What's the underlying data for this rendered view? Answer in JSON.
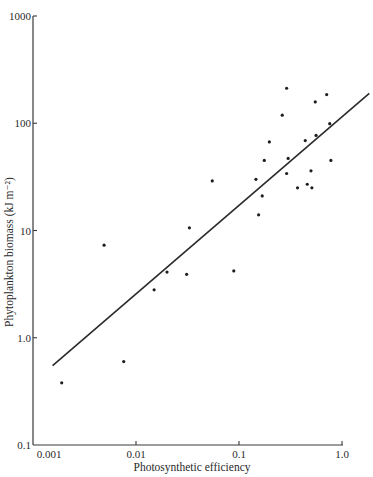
{
  "chart_data": {
    "type": "scatter",
    "title": "",
    "xlabel": "Photosynthetic efficiency",
    "ylabel": "Phytoplankton biomass (kJ m⁻²)",
    "xscale": "log",
    "yscale": "log",
    "xlim": [
      0.001,
      1.0
    ],
    "ylim": [
      0.1,
      1000
    ],
    "grid": false,
    "legend": null,
    "x_ticks": [
      {
        "value": 0.001,
        "label": "0.001"
      },
      {
        "value": 0.01,
        "label": "0.01"
      },
      {
        "value": 0.1,
        "label": "0.1"
      },
      {
        "value": 1.0,
        "label": "1.0"
      }
    ],
    "y_ticks": [
      {
        "value": 0.1,
        "label": "0.1"
      },
      {
        "value": 1.0,
        "label": "1.0"
      },
      {
        "value": 10,
        "label": "10"
      },
      {
        "value": 100,
        "label": "100"
      },
      {
        "value": 1000,
        "label": "1000"
      }
    ],
    "series": [
      {
        "name": "observations",
        "type": "scatter",
        "points": [
          {
            "x": 0.0019,
            "y": 0.38
          },
          {
            "x": 0.0049,
            "y": 7.3
          },
          {
            "x": 0.0076,
            "y": 0.6
          },
          {
            "x": 0.015,
            "y": 2.8
          },
          {
            "x": 0.02,
            "y": 4.1
          },
          {
            "x": 0.031,
            "y": 3.9
          },
          {
            "x": 0.033,
            "y": 10.6
          },
          {
            "x": 0.055,
            "y": 29
          },
          {
            "x": 0.089,
            "y": 4.2
          },
          {
            "x": 0.146,
            "y": 30
          },
          {
            "x": 0.155,
            "y": 14
          },
          {
            "x": 0.168,
            "y": 21
          },
          {
            "x": 0.176,
            "y": 45
          },
          {
            "x": 0.197,
            "y": 67
          },
          {
            "x": 0.263,
            "y": 119
          },
          {
            "x": 0.29,
            "y": 212
          },
          {
            "x": 0.29,
            "y": 34
          },
          {
            "x": 0.3,
            "y": 47
          },
          {
            "x": 0.37,
            "y": 25
          },
          {
            "x": 0.44,
            "y": 69
          },
          {
            "x": 0.46,
            "y": 27
          },
          {
            "x": 0.5,
            "y": 36
          },
          {
            "x": 0.51,
            "y": 25
          },
          {
            "x": 0.55,
            "y": 158
          },
          {
            "x": 0.56,
            "y": 77
          },
          {
            "x": 0.71,
            "y": 185
          },
          {
            "x": 0.76,
            "y": 99
          },
          {
            "x": 0.78,
            "y": 45
          }
        ]
      },
      {
        "name": "regression line",
        "type": "line",
        "points": [
          {
            "x": 0.00155,
            "y": 0.55
          },
          {
            "x": 1.84,
            "y": 190
          }
        ]
      }
    ]
  },
  "plot_area": {
    "x0": 33,
    "x1": 342,
    "y_top": 16,
    "y_bottom": 445
  }
}
